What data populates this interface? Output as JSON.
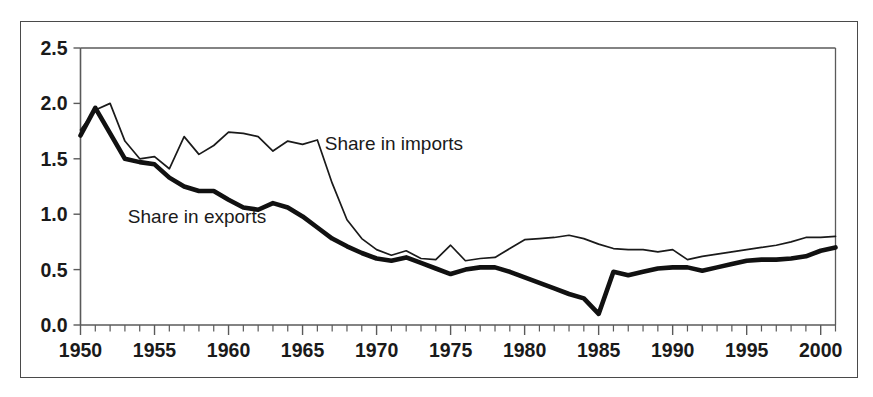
{
  "chart_data": {
    "type": "line",
    "title": "",
    "subtitle": "",
    "xlabel": "",
    "ylabel": "",
    "xlim": [
      1950,
      2001
    ],
    "ylim": [
      0.0,
      2.5
    ],
    "grid": false,
    "legend_position": "inline-annotations",
    "y_ticks": [
      "0.0",
      "0.5",
      "1.0",
      "1.5",
      "2.0",
      "2.5"
    ],
    "y_tick_values": [
      0.0,
      0.5,
      1.0,
      1.5,
      2.0,
      2.5
    ],
    "x_ticks": [
      "1950",
      "1955",
      "1960",
      "1965",
      "1970",
      "1975",
      "1980",
      "1985",
      "1990",
      "1995",
      "2000"
    ],
    "x_tick_values": [
      1950,
      1955,
      1960,
      1965,
      1970,
      1975,
      1980,
      1985,
      1990,
      1995,
      2000
    ],
    "x_minor_tick_step": 1,
    "annotations": [
      {
        "name": "share-in-imports-label",
        "text": "Share in imports",
        "x": 1966.5,
        "y": 1.58
      },
      {
        "name": "share-in-exports-label",
        "text": "Share in exports",
        "x": 1953.2,
        "y": 0.92
      }
    ],
    "x": [
      1950,
      1951,
      1952,
      1953,
      1954,
      1955,
      1956,
      1957,
      1958,
      1959,
      1960,
      1961,
      1962,
      1963,
      1964,
      1965,
      1966,
      1967,
      1968,
      1969,
      1970,
      1971,
      1972,
      1973,
      1974,
      1975,
      1976,
      1977,
      1978,
      1979,
      1980,
      1981,
      1982,
      1983,
      1984,
      1985,
      1986,
      1987,
      1988,
      1989,
      1990,
      1991,
      1992,
      1993,
      1994,
      1995,
      1996,
      1997,
      1998,
      1999,
      2000,
      2001
    ],
    "series": [
      {
        "name": "Share in imports",
        "style": "thin",
        "color": "#1a1a1a",
        "values": [
          1.76,
          1.94,
          2.0,
          1.66,
          1.5,
          1.52,
          1.41,
          1.7,
          1.54,
          1.62,
          1.74,
          1.73,
          1.7,
          1.57,
          1.66,
          1.63,
          1.67,
          1.28,
          0.95,
          0.78,
          0.68,
          0.63,
          0.67,
          0.6,
          0.59,
          0.72,
          0.58,
          0.6,
          0.61,
          0.69,
          0.77,
          0.78,
          0.79,
          0.81,
          0.78,
          0.73,
          0.69,
          0.68,
          0.68,
          0.66,
          0.68,
          0.59,
          0.62,
          0.64,
          0.66,
          0.68,
          0.7,
          0.72,
          0.75,
          0.79,
          0.79,
          0.8
        ]
      },
      {
        "name": "Share in exports",
        "style": "thick",
        "color": "#111111",
        "values": [
          1.71,
          1.96,
          1.73,
          1.5,
          1.47,
          1.45,
          1.33,
          1.25,
          1.21,
          1.21,
          1.13,
          1.06,
          1.04,
          1.1,
          1.06,
          0.98,
          0.88,
          0.78,
          0.71,
          0.65,
          0.6,
          0.58,
          0.61,
          0.56,
          0.51,
          0.46,
          0.5,
          0.52,
          0.52,
          0.48,
          0.43,
          0.38,
          0.33,
          0.28,
          0.24,
          0.1,
          0.48,
          0.45,
          0.48,
          0.51,
          0.52,
          0.52,
          0.49,
          0.52,
          0.55,
          0.58,
          0.59,
          0.59,
          0.6,
          0.62,
          0.67,
          0.7
        ]
      }
    ]
  }
}
